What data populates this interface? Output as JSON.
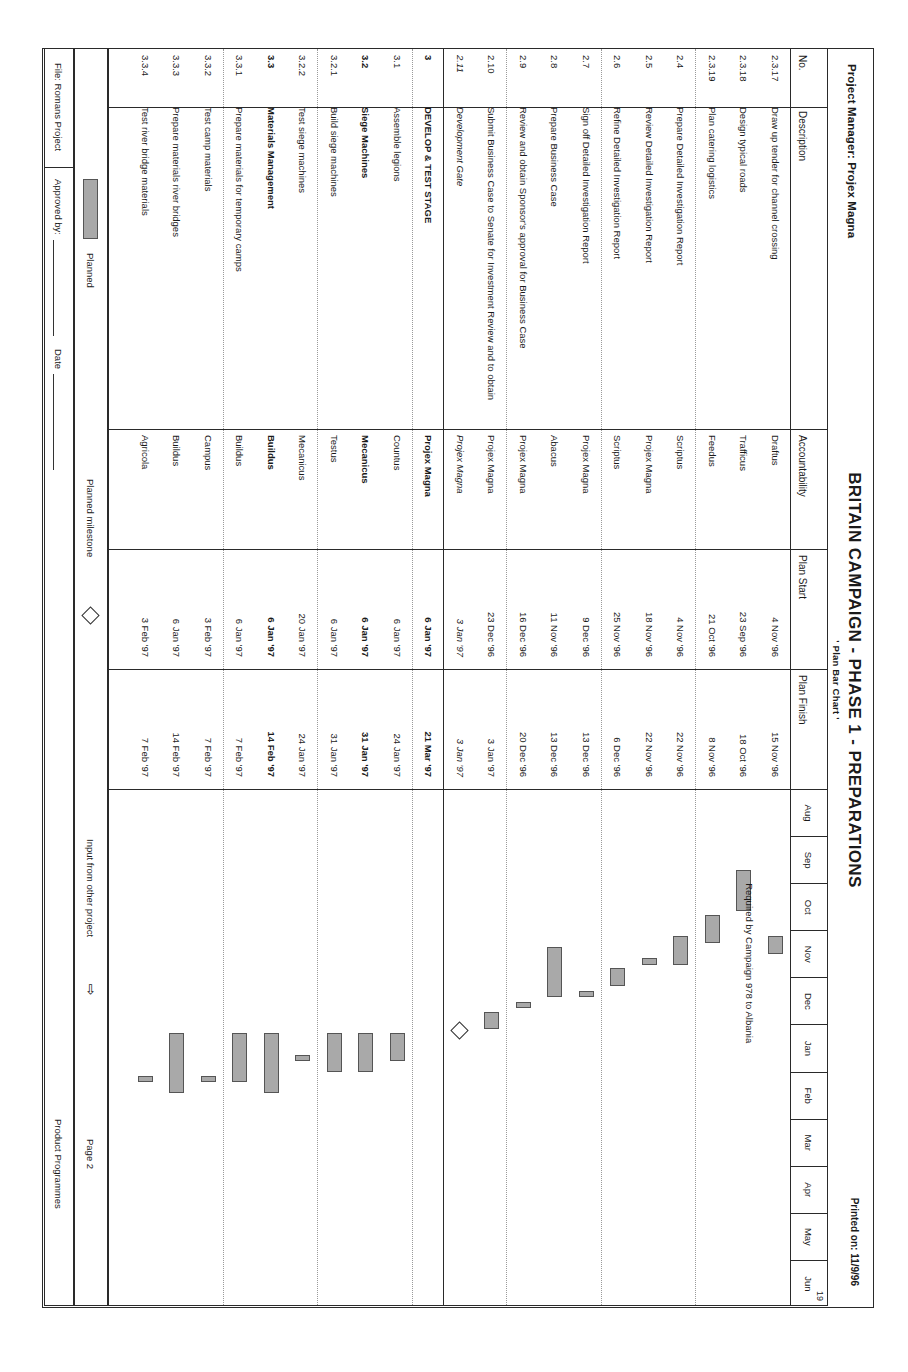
{
  "header": {
    "project_manager": "Project Manager: Projex Magna",
    "title": "BRITAIN CAMPAIGN - PHASE 1 - PREPARATIONS",
    "subtitle": "' Plan Bar Chart '",
    "printed_on": "Printed on: 11/9/96"
  },
  "columns": {
    "no": "No.",
    "description": "Description",
    "accountability": "Accountability",
    "plan_start": "Plan Start",
    "plan_finish": "Plan Finish"
  },
  "timeline": {
    "year_label": "19",
    "months": [
      "Aug",
      "Sep",
      "Oct",
      "Nov",
      "Dec",
      "Jan",
      "Feb",
      "Mar",
      "Apr",
      "May",
      "Jun"
    ]
  },
  "annotation": "Required by Campaign 978 to Albania",
  "rows": [
    {
      "no": "2.3.17",
      "description": "Draw up tender for channel crossing",
      "accountability": "Draftus",
      "plan_start": "4 Nov '96",
      "plan_finish": "15 Nov '96",
      "indent": 2,
      "style": "normal",
      "bar": {
        "start": 3.13,
        "end": 3.5
      }
    },
    {
      "no": "2.3.18",
      "description": "Design typical roads",
      "accountability": "Trafficus",
      "plan_start": "23 Sep '96",
      "plan_finish": "18 Oct '96",
      "indent": 2,
      "style": "normal",
      "bar": {
        "start": 1.73,
        "end": 2.6
      }
    },
    {
      "no": "2.3.19",
      "description": "Plan catering logistics",
      "accountability": "Feedus",
      "plan_start": "21 Oct '96",
      "plan_finish": "8 Nov '96",
      "indent": 2,
      "style": "normal",
      "bar": {
        "start": 2.68,
        "end": 3.27
      }
    },
    {
      "no": "2.4",
      "description": "Prepare Detailed Investigation Report",
      "accountability": "Scriptus",
      "plan_start": "4 Nov '96",
      "plan_finish": "22 Nov '96",
      "indent": 1,
      "style": "normal",
      "bar": {
        "start": 3.13,
        "end": 3.73
      }
    },
    {
      "no": "2.5",
      "description": "Review Detailed Investigation Report",
      "accountability": "Projex Magna",
      "plan_start": "18 Nov '96",
      "plan_finish": "22 Nov '96",
      "indent": 1,
      "style": "normal",
      "bar": {
        "start": 3.58,
        "end": 3.73
      }
    },
    {
      "no": "2.6",
      "description": "Refine Detailed Investigation Report",
      "accountability": "Scriptus",
      "plan_start": "25 Nov '96",
      "plan_finish": "6 Dec '96",
      "indent": 1,
      "style": "normal",
      "bar": {
        "start": 3.81,
        "end": 4.19
      }
    },
    {
      "no": "2.7",
      "description": "Sign off Detailed Investigation Report",
      "accountability": "Projex Magna",
      "plan_start": "9 Dec '96",
      "plan_finish": "13 Dec '96",
      "indent": 1,
      "style": "normal",
      "bar": {
        "start": 4.29,
        "end": 4.42
      }
    },
    {
      "no": "2.8",
      "description": "Prepare Business Case",
      "accountability": "Abacus",
      "plan_start": "11 Nov '96",
      "plan_finish": "13 Dec '96",
      "indent": 1,
      "style": "normal",
      "bar": {
        "start": 3.35,
        "end": 4.42
      }
    },
    {
      "no": "2.9",
      "description": "Review and obtain Sponsor's approval for Business Case",
      "accountability": "Projex Magna",
      "plan_start": "16 Dec '96",
      "plan_finish": "20 Dec '96",
      "indent": 1,
      "style": "normal",
      "bar": {
        "start": 4.52,
        "end": 4.65
      }
    },
    {
      "no": "2.10",
      "description": "Submit Business Case to Senate for Investment Review and to obtain",
      "accountability": "Projex Magna",
      "plan_start": "23 Dec '96",
      "plan_finish": "3 Jan '97",
      "indent": 1,
      "style": "normal",
      "bar": {
        "start": 4.74,
        "end": 5.1
      }
    },
    {
      "no": "2.11",
      "description": "Development Gate",
      "accountability": "Projex Magna",
      "plan_start": "3 Jan '97",
      "plan_finish": "3 Jan '97",
      "indent": 1,
      "style": "italic",
      "milestone": 5.1
    },
    {
      "no": "3",
      "description": "DEVELOP & TEST STAGE",
      "accountability": "Projex Magna",
      "plan_start": "6 Jan '97",
      "plan_finish": "21 Mar '97",
      "indent": 0,
      "style": "bold"
    },
    {
      "no": "3.1",
      "description": "Assemble legions",
      "accountability": "Countus",
      "plan_start": "6 Jan '97",
      "plan_finish": "24 Jan '97",
      "indent": 1,
      "style": "normal",
      "bar": {
        "start": 5.19,
        "end": 5.77
      }
    },
    {
      "no": "3.2",
      "description": "Siege Machines",
      "accountability": "Mecanicus",
      "plan_start": "6 Jan '97",
      "plan_finish": "31 Jan '97",
      "indent": 1,
      "style": "bold",
      "bar": {
        "start": 5.19,
        "end": 6.0
      }
    },
    {
      "no": "3.2.1",
      "description": "Build siege machines",
      "accountability": "Testus",
      "plan_start": "6 Jan '97",
      "plan_finish": "31 Jan '97",
      "indent": 2,
      "style": "normal",
      "bar": {
        "start": 5.19,
        "end": 6.0
      }
    },
    {
      "no": "3.2.2",
      "description": "Test siege machines",
      "accountability": "Mecanicus",
      "plan_start": "20 Jan '97",
      "plan_finish": "24 Jan '97",
      "indent": 2,
      "style": "normal",
      "bar": {
        "start": 5.64,
        "end": 5.77
      }
    },
    {
      "no": "3.3",
      "description": "Materials Management",
      "accountability": "Buildus",
      "plan_start": "6 Jan '97",
      "plan_finish": "14 Feb '97",
      "indent": 1,
      "style": "bold",
      "bar": {
        "start": 5.19,
        "end": 6.45
      }
    },
    {
      "no": "3.3.1",
      "description": "Prepare materials for temporary camps",
      "accountability": "Buildus",
      "plan_start": "6 Jan '97",
      "plan_finish": "7 Feb '97",
      "indent": 2,
      "style": "normal",
      "bar": {
        "start": 5.19,
        "end": 6.23
      }
    },
    {
      "no": "3.3.2",
      "description": "Test camp materials",
      "accountability": "Campus",
      "plan_start": "3 Feb '97",
      "plan_finish": "7 Feb '97",
      "indent": 2,
      "style": "normal",
      "bar": {
        "start": 6.1,
        "end": 6.23
      }
    },
    {
      "no": "3.3.3",
      "description": "Prepare materials river bridges",
      "accountability": "Buildus",
      "plan_start": "6 Jan '97",
      "plan_finish": "14 Feb '97",
      "indent": 2,
      "style": "normal",
      "bar": {
        "start": 5.19,
        "end": 6.45
      }
    },
    {
      "no": "3.3.4",
      "description": "Test river bridge materials",
      "accountability": "Agricola",
      "plan_start": "3 Feb '97",
      "plan_finish": "7 Feb '97",
      "indent": 2,
      "style": "normal",
      "bar": {
        "start": 6.1,
        "end": 6.23
      }
    }
  ],
  "legend": {
    "planned": "Planned",
    "planned_milestone": "Planned milestone",
    "input_from_other_project": "Input from other project",
    "arrow_glyph": "⇨"
  },
  "footer": {
    "approved_by": "Approved by:",
    "date": "Date",
    "file": "File: Romans Project",
    "page": "Page 2",
    "product_programmes": "Product Programmes"
  },
  "chart_data": {
    "type": "bar",
    "title": "BRITAIN CAMPAIGN - PHASE 1 - PREPARATIONS",
    "xlabel": "",
    "ylabel": "",
    "axis_months": [
      "Aug",
      "Sep",
      "Oct",
      "Nov",
      "Dec",
      "Jan",
      "Feb",
      "Mar",
      "Apr",
      "May",
      "Jun"
    ],
    "legend": [
      "Planned",
      "Planned milestone",
      "Input from other project"
    ],
    "grid": true,
    "tasks": [
      {
        "name": "Draw up tender for channel crossing",
        "start": "4 Nov '96",
        "finish": "15 Nov '96"
      },
      {
        "name": "Design typical roads",
        "start": "23 Sep '96",
        "finish": "18 Oct '96"
      },
      {
        "name": "Plan catering logistics",
        "start": "21 Oct '96",
        "finish": "8 Nov '96"
      },
      {
        "name": "Prepare Detailed Investigation Report",
        "start": "4 Nov '96",
        "finish": "22 Nov '96"
      },
      {
        "name": "Review Detailed Investigation Report",
        "start": "18 Nov '96",
        "finish": "22 Nov '96"
      },
      {
        "name": "Refine Detailed Investigation Report",
        "start": "25 Nov '96",
        "finish": "6 Dec '96"
      },
      {
        "name": "Sign off Detailed Investigation Report",
        "start": "9 Dec '96",
        "finish": "13 Dec '96"
      },
      {
        "name": "Prepare Business Case",
        "start": "11 Nov '96",
        "finish": "13 Dec '96"
      },
      {
        "name": "Review and obtain Sponsor's approval for Business Case",
        "start": "16 Dec '96",
        "finish": "20 Dec '96"
      },
      {
        "name": "Submit Business Case to Senate for Investment Review and to obtain",
        "start": "23 Dec '96",
        "finish": "3 Jan '97"
      },
      {
        "name": "Development Gate",
        "start": "3 Jan '97",
        "finish": "3 Jan '97",
        "milestone": true
      },
      {
        "name": "DEVELOP & TEST STAGE",
        "start": "6 Jan '97",
        "finish": "21 Mar '97",
        "summary": true
      },
      {
        "name": "Assemble legions",
        "start": "6 Jan '97",
        "finish": "24 Jan '97"
      },
      {
        "name": "Siege Machines",
        "start": "6 Jan '97",
        "finish": "31 Jan '97"
      },
      {
        "name": "Build siege machines",
        "start": "6 Jan '97",
        "finish": "31 Jan '97"
      },
      {
        "name": "Test siege machines",
        "start": "20 Jan '97",
        "finish": "24 Jan '97"
      },
      {
        "name": "Materials Management",
        "start": "6 Jan '97",
        "finish": "14 Feb '97"
      },
      {
        "name": "Prepare materials for temporary camps",
        "start": "6 Jan '97",
        "finish": "7 Feb '97"
      },
      {
        "name": "Test camp materials",
        "start": "3 Feb '97",
        "finish": "7 Feb '97"
      },
      {
        "name": "Prepare materials river bridges",
        "start": "6 Jan '97",
        "finish": "14 Feb '97"
      },
      {
        "name": "Test river bridge materials",
        "start": "3 Feb '97",
        "finish": "7 Feb '97"
      }
    ],
    "annotations": [
      "Required by Campaign 978 to Albania"
    ]
  }
}
